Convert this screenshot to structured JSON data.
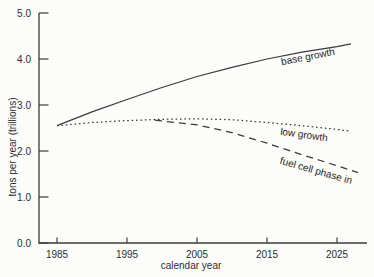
{
  "colors": {
    "background": "#fcfcfa",
    "axis": "#3b3b3b",
    "line": "#3b3b3b",
    "text": "#2e2e2e"
  },
  "chart_data": {
    "type": "line",
    "title": "",
    "xlabel": "calendar year",
    "ylabel": "tons per year (trillions)",
    "x_ticks": [
      1985,
      1995,
      2005,
      2015,
      2025
    ],
    "y_tick_labels": [
      "0.0",
      "1.0",
      "2.0",
      "3.0",
      "4.0",
      "5.0"
    ],
    "xlim": [
      1983,
      2029
    ],
    "ylim": [
      0,
      5
    ],
    "grid": false,
    "legend_position": "inline-labels",
    "series": [
      {
        "name": "base growth",
        "line_style": "solid",
        "points": [
          [
            1985,
            2.55
          ],
          [
            1990,
            2.85
          ],
          [
            1995,
            3.12
          ],
          [
            2000,
            3.38
          ],
          [
            2005,
            3.62
          ],
          [
            2010,
            3.82
          ],
          [
            2015,
            4.0
          ],
          [
            2020,
            4.15
          ],
          [
            2025,
            4.27
          ],
          [
            2027,
            4.33
          ]
        ]
      },
      {
        "name": "low growth",
        "line_style": "dotted",
        "points": [
          [
            1985,
            2.55
          ],
          [
            1990,
            2.62
          ],
          [
            1995,
            2.66
          ],
          [
            2000,
            2.69
          ],
          [
            2005,
            2.7
          ],
          [
            2010,
            2.68
          ],
          [
            2015,
            2.62
          ],
          [
            2020,
            2.55
          ],
          [
            2025,
            2.47
          ],
          [
            2027,
            2.43
          ]
        ]
      },
      {
        "name": "fuel cell phase in",
        "line_style": "dashed",
        "points": [
          [
            1999,
            2.67
          ],
          [
            2005,
            2.57
          ],
          [
            2010,
            2.4
          ],
          [
            2015,
            2.17
          ],
          [
            2020,
            1.92
          ],
          [
            2025,
            1.68
          ],
          [
            2028,
            1.53
          ]
        ]
      }
    ],
    "annotations": [
      {
        "text": "base growth",
        "year": 2020.9,
        "value": 4.04,
        "angle": -11
      },
      {
        "text": "low growth",
        "year": 2020.3,
        "value": 2.35,
        "angle": 8
      },
      {
        "text": "fuel cell phase in",
        "year": 2022.0,
        "value": 1.57,
        "angle": 16
      }
    ]
  }
}
